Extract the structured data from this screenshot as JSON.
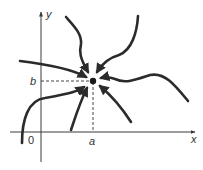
{
  "diagram": {
    "axes": {
      "x_label": "x",
      "y_label": "y",
      "origin_label": "0"
    },
    "point": {
      "x_label": "a",
      "y_label": "b"
    },
    "trajectory_count": 8,
    "colors": {
      "curve": "#2b2b2b",
      "axis": "#3a3a3a"
    }
  }
}
